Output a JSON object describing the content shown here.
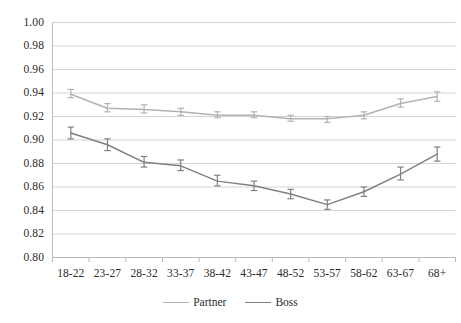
{
  "chart_data": {
    "type": "line",
    "title": "",
    "subtitle": "",
    "xlabel": "",
    "ylabel": "",
    "categories": [
      "18-22",
      "23-27",
      "28-32",
      "33-37",
      "38-42",
      "43-47",
      "48-52",
      "53-57",
      "58-62",
      "63-67",
      "68+"
    ],
    "ylim": [
      0.8,
      1.0
    ],
    "yticks": [
      "0.80",
      "0.82",
      "0.84",
      "0.86",
      "0.88",
      "0.90",
      "0.92",
      "0.94",
      "0.96",
      "0.98",
      "1.00"
    ],
    "ytick_values": [
      0.8,
      0.82,
      0.84,
      0.86,
      0.88,
      0.9,
      0.92,
      0.94,
      0.96,
      0.98,
      1.0
    ],
    "grid": true,
    "grid_axis": "y",
    "legend_position": "bottom-center",
    "error_bars": true,
    "series": [
      {
        "name": "Partner",
        "color": "#b3b3b3",
        "values": [
          0.939,
          0.927,
          0.926,
          0.924,
          0.921,
          0.921,
          0.918,
          0.918,
          0.921,
          0.931,
          0.937
        ],
        "err_low": [
          0.936,
          0.924,
          0.923,
          0.921,
          0.919,
          0.919,
          0.916,
          0.915,
          0.918,
          0.928,
          0.933
        ],
        "err_high": [
          0.943,
          0.931,
          0.93,
          0.927,
          0.924,
          0.924,
          0.921,
          0.92,
          0.924,
          0.935,
          0.941
        ]
      },
      {
        "name": "Boss",
        "color": "#808080",
        "values": [
          0.906,
          0.896,
          0.881,
          0.878,
          0.865,
          0.861,
          0.854,
          0.845,
          0.856,
          0.871,
          0.888
        ],
        "err_low": [
          0.901,
          0.891,
          0.877,
          0.874,
          0.861,
          0.857,
          0.85,
          0.841,
          0.852,
          0.866,
          0.882
        ],
        "err_high": [
          0.911,
          0.901,
          0.886,
          0.883,
          0.87,
          0.865,
          0.858,
          0.849,
          0.86,
          0.877,
          0.894
        ]
      }
    ]
  },
  "legend": {
    "items": [
      {
        "label": "Partner"
      },
      {
        "label": "Boss"
      }
    ]
  },
  "colors": {
    "partner": "#b3b3b3",
    "boss": "#808080",
    "grid": "#d4d4d4",
    "axis": "#b9b9b9",
    "text": "#2b2b2b"
  }
}
